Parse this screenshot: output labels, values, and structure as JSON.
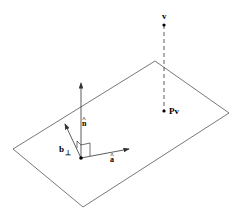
{
  "diagram": {
    "type": "geometry",
    "plane": {
      "corners": [
        [
          13,
          149
        ],
        [
          155,
          61
        ],
        [
          229,
          113
        ],
        [
          83,
          207
        ]
      ]
    },
    "labels": {
      "v": "v",
      "pv": "Pv",
      "n_hat": "n",
      "a_hat": "a",
      "b_perp": "b",
      "hat_mark": "^",
      "perp_sub": "⊥"
    },
    "colors": {
      "line": "#555555",
      "ink": "#000000"
    }
  }
}
